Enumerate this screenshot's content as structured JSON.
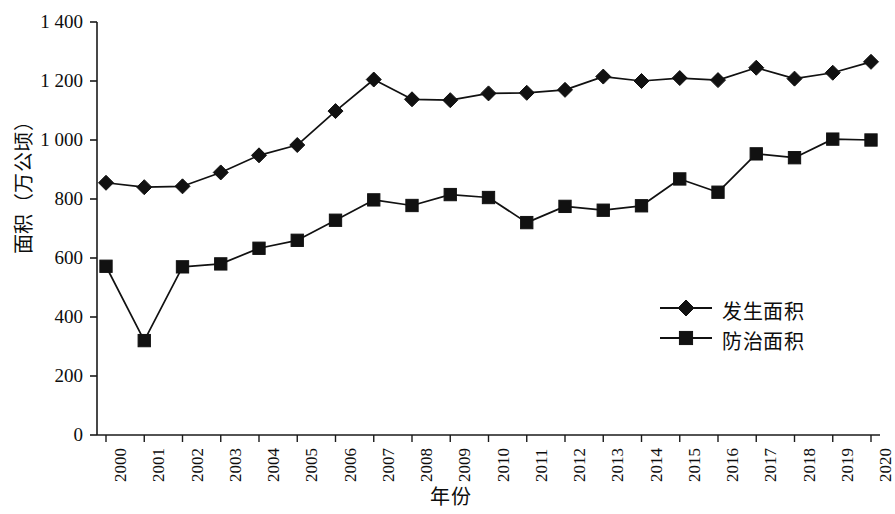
{
  "chart_data": {
    "type": "line",
    "title": "",
    "xlabel": "年份",
    "ylabel": "面积（万公顷）",
    "categories": [
      "2000",
      "2001",
      "2002",
      "2003",
      "2004",
      "2005",
      "2006",
      "2007",
      "2008",
      "2009",
      "2010",
      "2011",
      "2012",
      "2013",
      "2014",
      "2015",
      "2016",
      "2017",
      "2018",
      "2019",
      "2020"
    ],
    "x": [
      2000,
      2001,
      2002,
      2003,
      2004,
      2005,
      2006,
      2007,
      2008,
      2009,
      2010,
      2011,
      2012,
      2013,
      2014,
      2015,
      2016,
      2017,
      2018,
      2019,
      2020
    ],
    "series": [
      {
        "name": "发生面积",
        "marker": "diamond",
        "color": "#111111",
        "values": [
          855,
          840,
          843,
          890,
          948,
          983,
          1098,
          1205,
          1138,
          1135,
          1158,
          1160,
          1170,
          1215,
          1200,
          1210,
          1203,
          1245,
          1208,
          1228,
          1265
        ]
      },
      {
        "name": "防治面积",
        "marker": "square",
        "color": "#111111",
        "values": [
          572,
          320,
          570,
          580,
          633,
          660,
          728,
          797,
          778,
          815,
          805,
          720,
          775,
          762,
          777,
          868,
          823,
          953,
          940,
          1003,
          1000
        ]
      }
    ],
    "ylim": [
      0,
      1400
    ],
    "yticks": [
      0,
      200,
      400,
      600,
      800,
      1000,
      1200,
      1400
    ],
    "ytick_labels": [
      "0",
      "200",
      "400",
      "600",
      "800",
      "1 000",
      "1 200",
      "1 400"
    ],
    "grid": false,
    "legend_position": "center-right"
  },
  "legend": {
    "entries": [
      {
        "label": "发生面积",
        "marker": "diamond-marker-icon"
      },
      {
        "label": "防治面积",
        "marker": "square-marker-icon"
      }
    ]
  }
}
